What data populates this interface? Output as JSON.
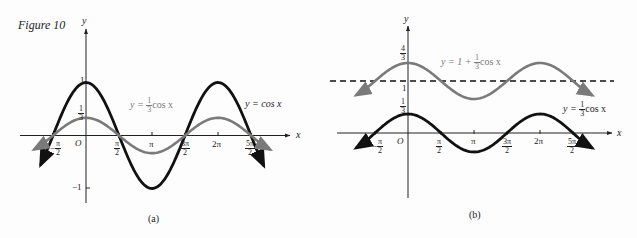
{
  "figure": {
    "title": "Figure 10",
    "panel_a_caption": "(a)",
    "panel_b_caption": "(b)"
  },
  "colors": {
    "ink": "#111111",
    "gray_curve": "#7a7a7a",
    "background": "#fdfdfd"
  },
  "panel_a": {
    "axis_x_label": "x",
    "axis_y_label": "y",
    "origin_label": "O",
    "y_ticks": {
      "one": "1",
      "third_num": "1",
      "third_den": "3",
      "neg_one": "−1"
    },
    "x_ticks": [
      {
        "num": "π",
        "den": "2",
        "neg": true
      },
      {
        "num": "π",
        "den": "2"
      },
      {
        "plain": "π"
      },
      {
        "num": "3π",
        "den": "2"
      },
      {
        "plain": "2π"
      },
      {
        "num": "5π",
        "den": "2"
      }
    ],
    "labels": {
      "third_cos": {
        "prefix": "y = ",
        "num": "1",
        "den": "3",
        "suffix": "cos x"
      },
      "cos": {
        "text": "y =  cos x"
      }
    }
  },
  "panel_b": {
    "axis_x_label": "x",
    "axis_y_label": "y",
    "origin_label": "O",
    "y_ticks": {
      "four_thirds_num": "4",
      "four_thirds_den": "3",
      "one": "1",
      "third_num": "1",
      "third_den": "3"
    },
    "labels": {
      "shifted": {
        "prefix": "y = 1 + ",
        "num": "1",
        "den": "3",
        "suffix": "cos x"
      },
      "third_cos": {
        "prefix": "y = ",
        "num": "1",
        "den": "3",
        "suffix": "cos x"
      }
    }
  },
  "chart_data": [
    {
      "type": "line",
      "title": "Figure 10 (a)",
      "xlabel": "x",
      "ylabel": "y",
      "x_ticks": [
        "-π/2",
        "π/2",
        "π",
        "3π/2",
        "2π",
        "5π/2"
      ],
      "y_ticks": [
        "1",
        "1/3",
        "-1"
      ],
      "xlim": [
        -2.4,
        8.6
      ],
      "ylim": [
        -1.3,
        1.9
      ],
      "grid": false,
      "series": [
        {
          "name": "y = cos x",
          "color": "#111111",
          "x": [
            -2.2,
            -1.5708,
            0,
            1.5708,
            3.1416,
            4.7124,
            6.2832,
            7.854,
            8.5
          ],
          "y": [
            -0.59,
            0,
            1,
            0,
            -1,
            0,
            1,
            0,
            -0.6
          ]
        },
        {
          "name": "y = (1/3)cos x",
          "color": "#7a7a7a",
          "x": [
            -2.4,
            -1.5708,
            0,
            1.5708,
            3.1416,
            4.7124,
            6.2832,
            7.854,
            8.6
          ],
          "y": [
            -0.24,
            0,
            0.333,
            0,
            -0.333,
            0,
            0.333,
            0,
            -0.22
          ]
        }
      ]
    },
    {
      "type": "line",
      "title": "Figure 10 (b)",
      "xlabel": "x",
      "ylabel": "y",
      "x_ticks": [
        "-π/2",
        "π/2",
        "π",
        "3π/2",
        "2π",
        "5π/2"
      ],
      "y_ticks": [
        "4/3",
        "1",
        "1/3"
      ],
      "xlim": [
        -2.4,
        8.6
      ],
      "ylim": [
        -1.2,
        1.9
      ],
      "grid": false,
      "annotations": [
        "dashed horizontal line at y = 1"
      ],
      "series": [
        {
          "name": "y = 1 + (1/3)cos x",
          "color": "#7a7a7a",
          "x": [
            -2.4,
            -1.5708,
            0,
            1.5708,
            3.1416,
            4.7124,
            6.2832,
            7.854,
            8.6
          ],
          "y": [
            0.76,
            1,
            1.333,
            1,
            0.667,
            1,
            1.333,
            1,
            0.78
          ]
        },
        {
          "name": "y = (1/3)cos x",
          "color": "#111111",
          "x": [
            -2.4,
            -1.5708,
            0,
            1.5708,
            3.1416,
            4.7124,
            6.2832,
            7.854,
            8.6
          ],
          "y": [
            -0.24,
            0,
            0.333,
            0,
            -0.333,
            0,
            0.333,
            0,
            -0.22
          ]
        },
        {
          "name": "y = 1 (dashed)",
          "color": "#111111",
          "x": [
            -2.4,
            8.6
          ],
          "y": [
            1,
            1
          ]
        }
      ]
    }
  ]
}
